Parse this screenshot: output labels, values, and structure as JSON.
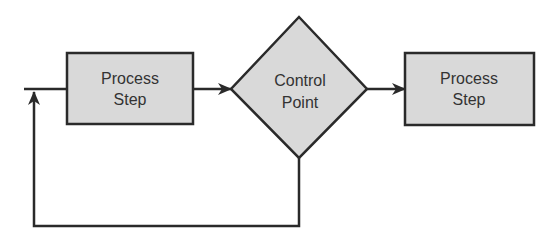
{
  "diagram": {
    "type": "process-control-flowchart",
    "colors": {
      "shape_fill": "#d9d9d9",
      "stroke": "#2a2a2a",
      "text": "#333333"
    },
    "nodes": [
      {
        "id": "process-step-1",
        "shape": "rectangle",
        "line1": "Process",
        "line2": "Step"
      },
      {
        "id": "control-point",
        "shape": "diamond",
        "line1": "Control",
        "line2": "Point"
      },
      {
        "id": "process-step-2",
        "shape": "rectangle",
        "line1": "Process",
        "line2": "Step"
      }
    ],
    "edges": [
      {
        "from": "input",
        "to": "process-step-1",
        "arrow": false
      },
      {
        "from": "process-step-1",
        "to": "control-point",
        "arrow": true
      },
      {
        "from": "control-point",
        "to": "process-step-2",
        "arrow": true
      },
      {
        "from": "control-point",
        "to": "input",
        "label": "feedback loop",
        "arrow": true
      }
    ]
  }
}
